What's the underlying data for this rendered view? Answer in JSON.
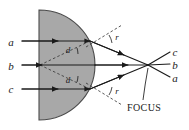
{
  "figure": {
    "type": "optics-ray-diagram",
    "background_color": "#ffffff",
    "mirror": {
      "name": "concave-spherical-mirror",
      "fill_color": "#a8a8a8",
      "stroke_color": "#4a4a4a",
      "center_x": 39,
      "center_y": 65,
      "radius": 56,
      "flat_edge_x": 39,
      "top_y": 10,
      "bottom_y": 120,
      "apex_x": 95
    },
    "incoming_rays": [
      {
        "label": "a",
        "label_x": 11,
        "label_y": 46,
        "y": 41,
        "start_x": 22,
        "end_x": 90
      },
      {
        "label": "b",
        "label_x": 11,
        "label_y": 70,
        "y": 65,
        "start_x": 22,
        "end_x": 95
      },
      {
        "label": "c",
        "label_x": 11,
        "label_y": 93,
        "y": 89,
        "start_x": 22,
        "end_x": 90
      }
    ],
    "outgoing_labels": [
      {
        "label": "c",
        "x": 173,
        "y": 53
      },
      {
        "label": "b",
        "x": 173,
        "y": 66
      },
      {
        "label": "a",
        "x": 173,
        "y": 79
      }
    ],
    "angle_labels": [
      {
        "label": "d",
        "name": "angle-of-incidence-upper",
        "x": 68,
        "y": 53
      },
      {
        "label": "d",
        "name": "angle-of-incidence-lower",
        "x": 68,
        "y": 83
      },
      {
        "label": "r",
        "name": "angle-of-reflection-upper",
        "x": 116,
        "y": 39
      },
      {
        "label": "r",
        "name": "angle-of-reflection-lower",
        "x": 116,
        "y": 93
      }
    ],
    "focus": {
      "label": "FOCUS",
      "label_x": 127,
      "label_y": 108,
      "point_x": 148,
      "point_y": 65
    },
    "colors": {
      "ray": "#1a1a1a",
      "dashed": "#3a3a3a",
      "mirror_fill": "#a8a8a8",
      "mirror_stroke": "#4a4a4a",
      "text": "#1a1a1a"
    }
  }
}
